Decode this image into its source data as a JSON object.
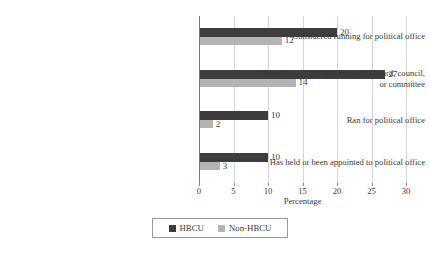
{
  "chart_data": {
    "type": "bar",
    "orientation": "horizontal",
    "title": "",
    "subtitle": "",
    "xlabel": "Percentage",
    "ylabel": "",
    "xlim": [
      0,
      30
    ],
    "xticks": [
      0,
      5,
      10,
      15,
      20,
      25,
      30
    ],
    "xtick_labels": [
      "0",
      "5",
      "10",
      "15",
      "20",
      "25",
      "30"
    ],
    "grid": true,
    "grid_axis": "x",
    "legend_position": "bottom-center",
    "categories": [
      "Considered running for political office",
      "Served on a local governmental board, council, or committee",
      "Ran for political office",
      "Has held or been appointed to political office"
    ],
    "category_lines": [
      [
        "Considered running for political office"
      ],
      [
        "Served on a local governmental board, council,",
        "or committee"
      ],
      [
        "Ran for political office"
      ],
      [
        "Has held or been appointed to political office"
      ]
    ],
    "series": [
      {
        "name": "HBCU",
        "color": "#3d3d3d",
        "values": [
          20,
          27,
          10,
          10
        ],
        "value_labels": [
          "20",
          "27",
          "10",
          "10"
        ]
      },
      {
        "name": "Non-HBCU",
        "color": "#b4b4b4",
        "values": [
          12,
          14,
          2,
          3
        ],
        "value_labels": [
          "12",
          "14",
          "2",
          "3"
        ]
      }
    ]
  },
  "legend": {
    "entries": [
      {
        "label": "HBCU",
        "color": "#3d3d3d"
      },
      {
        "label": "Non-HBCU",
        "color": "#b4b4b4"
      }
    ]
  },
  "axis": {
    "x_title": "Percentage"
  },
  "colors": {
    "hbcu": "#3d3d3d",
    "non_hbcu": "#b4b4b4",
    "gridline": "#d6d6d6",
    "axis": "#7a7a7a",
    "text": "#3a3a3a",
    "background": "#ffffff"
  }
}
